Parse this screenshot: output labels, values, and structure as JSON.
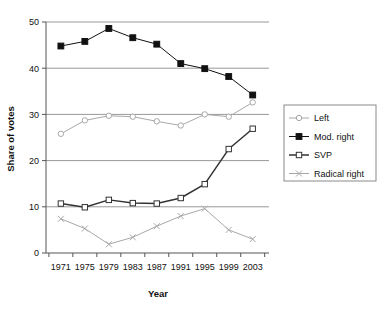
{
  "chart_data": {
    "type": "line",
    "title": "",
    "subtitle": "",
    "xlabel": "Year",
    "ylabel": "Share of votes",
    "categories": [
      "1971",
      "1975",
      "1979",
      "1983",
      "1987",
      "1991",
      "1995",
      "1999",
      "2003"
    ],
    "xlim": [
      1971,
      2003
    ],
    "ylim": [
      0,
      50
    ],
    "yticks": [
      0,
      10,
      20,
      30,
      40,
      50
    ],
    "grid": "horizontal",
    "legend_position": "right",
    "series": [
      {
        "name": "Left",
        "marker": "open-circle",
        "color": "#a8a8a8",
        "values": [
          25.8,
          28.7,
          29.7,
          29.5,
          28.5,
          27.6,
          30.0,
          29.5,
          32.6
        ]
      },
      {
        "name": "Mod. right",
        "marker": "filled-square",
        "color": "#111111",
        "values": [
          44.8,
          45.8,
          48.6,
          46.6,
          45.2,
          41.0,
          39.9,
          38.2,
          34.2
        ]
      },
      {
        "name": "SVP",
        "marker": "open-square",
        "color": "#333333",
        "values": [
          10.7,
          9.9,
          11.5,
          10.8,
          10.7,
          11.9,
          14.9,
          22.5,
          26.9
        ]
      },
      {
        "name": "Radical right",
        "marker": "cross",
        "color": "#a8a8a8",
        "values": [
          7.4,
          5.3,
          1.9,
          3.4,
          5.8,
          8.0,
          9.6,
          5.0,
          3.0
        ]
      }
    ]
  },
  "axes": {
    "y_title": "Share of votes",
    "x_title": "Year",
    "y_ticks": [
      "0",
      "10",
      "20",
      "30",
      "40",
      "50"
    ],
    "x_ticks": [
      "1971",
      "1975",
      "1979",
      "1983",
      "1987",
      "1991",
      "1995",
      "1999",
      "2003"
    ]
  },
  "legend": {
    "items": [
      {
        "label": "Left",
        "marker": "open-circle"
      },
      {
        "label": "Mod. right",
        "marker": "filled-square"
      },
      {
        "label": "SVP",
        "marker": "open-square"
      },
      {
        "label": "Radical right",
        "marker": "cross"
      }
    ]
  },
  "colors": {
    "grid": "#999999",
    "axis": "#555555",
    "dark_series": "#111111",
    "light_series": "#a8a8a8",
    "background": "#ffffff"
  }
}
